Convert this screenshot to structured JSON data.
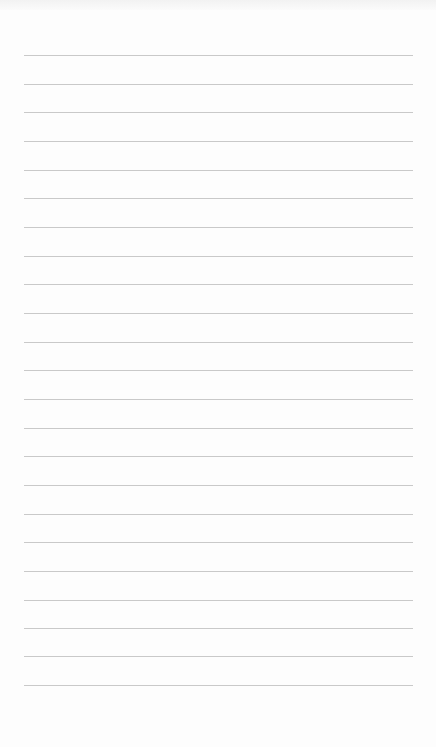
{
  "page": {
    "type": "lined-paper",
    "line_color": "#c9c9c9",
    "background_color": "#fdfdfd",
    "line_count": 23,
    "line_left": 24,
    "line_right": 413,
    "lines_y": [
      55,
      84,
      112,
      141,
      170,
      198,
      227,
      256,
      284,
      313,
      342,
      370,
      399,
      428,
      456,
      485,
      514,
      542,
      571,
      600,
      628,
      656,
      685
    ]
  }
}
